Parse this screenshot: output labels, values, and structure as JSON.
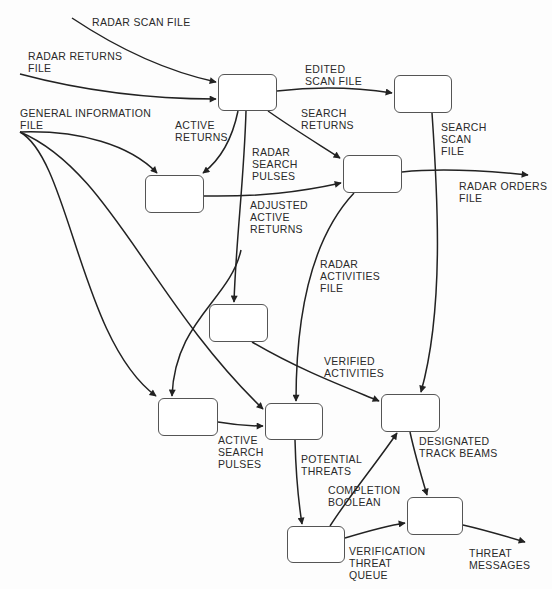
{
  "diagram": {
    "type": "data-flow-diagram",
    "colors": {
      "line": "#222222",
      "box_border": "#555555",
      "text": "#2a2a2a",
      "background": "#fdfdfd"
    },
    "processes": [
      {
        "id": "p1",
        "x": 218,
        "y": 74,
        "w": 59,
        "h": 37
      },
      {
        "id": "p2",
        "x": 394,
        "y": 75,
        "w": 58,
        "h": 38
      },
      {
        "id": "p3",
        "x": 145,
        "y": 175,
        "w": 59,
        "h": 38
      },
      {
        "id": "p4",
        "x": 343,
        "y": 155,
        "w": 59,
        "h": 38
      },
      {
        "id": "p5",
        "x": 209,
        "y": 304,
        "w": 59,
        "h": 38
      },
      {
        "id": "p6",
        "x": 158,
        "y": 398,
        "w": 60,
        "h": 38
      },
      {
        "id": "p7",
        "x": 265,
        "y": 403,
        "w": 58,
        "h": 37
      },
      {
        "id": "p8",
        "x": 381,
        "y": 394,
        "w": 59,
        "h": 38
      },
      {
        "id": "p9",
        "x": 407,
        "y": 497,
        "w": 56,
        "h": 38
      },
      {
        "id": "p10",
        "x": 287,
        "y": 526,
        "w": 58,
        "h": 37
      }
    ],
    "labels": {
      "radar_scan_file": "RADAR SCAN FILE",
      "radar_returns_file": "RADAR RETURNS\nFILE",
      "general_information_file": "GENERAL INFORMATION\nFILE",
      "edited_scan_file": "EDITED\nSCAN FILE",
      "active_returns": "ACTIVE\nRETURNS",
      "search_returns": "SEARCH\nRETURNS",
      "radar_search_pulses": "RADAR\nSEARCH\nPULSES",
      "search_scan_file": "SEARCH\nSCAN\nFILE",
      "radar_orders_file": "RADAR ORDERS\nFILE",
      "adjusted_active_returns": "ADJUSTED\nACTIVE\nRETURNS",
      "radar_activities_file": "RADAR\nACTIVITIES\nFILE",
      "verified_activities": "VERIFIED\nACTIVITIES",
      "active_search_pulses": "ACTIVE\nSEARCH\nPULSES",
      "designated_track_beams": "DESIGNATED\nTRACK BEAMS",
      "potential_threats": "POTENTIAL\nTHREATS",
      "completion_boolean": "COMPLETION\nBOOLEAN",
      "verification_threat_queue": "VERIFICATION\nTHREAT\nQUEUE",
      "threat_messages": "THREAT\nMESSAGES"
    },
    "flows": [
      {
        "label": "RADAR SCAN FILE",
        "from": "external",
        "to": "p1"
      },
      {
        "label": "RADAR RETURNS FILE",
        "from": "external",
        "to": "p1"
      },
      {
        "label": "EDITED SCAN FILE",
        "from": "p1",
        "to": "p2"
      },
      {
        "label": "ACTIVE RETURNS",
        "from": "p1",
        "to": "p3"
      },
      {
        "label": "SEARCH RETURNS",
        "from": "p1",
        "to": "p4"
      },
      {
        "label": "RADAR SEARCH PULSES",
        "from": "p1",
        "to": "p5"
      },
      {
        "label": "GENERAL INFORMATION FILE",
        "from": "external",
        "to": "p3"
      },
      {
        "label": "GENERAL INFORMATION FILE",
        "from": "external",
        "to": "p6"
      },
      {
        "label": "GENERAL INFORMATION FILE",
        "from": "external",
        "to": "p7"
      },
      {
        "label": "ADJUSTED ACTIVE RETURNS",
        "from": "p3",
        "to": "p4"
      },
      {
        "label": "RADAR ORDERS FILE",
        "from": "p4",
        "to": "external"
      },
      {
        "label": "SEARCH SCAN FILE",
        "from": "p2",
        "to": "p8"
      },
      {
        "label": "RADAR ACTIVITIES FILE",
        "from": "p4",
        "to": "p7"
      },
      {
        "label": "VERIFIED ACTIVITIES",
        "from": "p5",
        "to": "p8"
      },
      {
        "label": "ACTIVE SEARCH PULSES",
        "from": "p6",
        "to": "p7"
      },
      {
        "label": "POTENTIAL THREATS",
        "from": "p7",
        "to": "p10"
      },
      {
        "label": "COMPLETION BOOLEAN",
        "from": "p10",
        "to": "p8"
      },
      {
        "label": "DESIGNATED TRACK BEAMS",
        "from": "p8",
        "to": "p9"
      },
      {
        "label": "VERIFICATION THREAT QUEUE",
        "from": "p10",
        "to": "p9"
      },
      {
        "label": "THREAT MESSAGES",
        "from": "p9",
        "to": "external"
      }
    ]
  }
}
